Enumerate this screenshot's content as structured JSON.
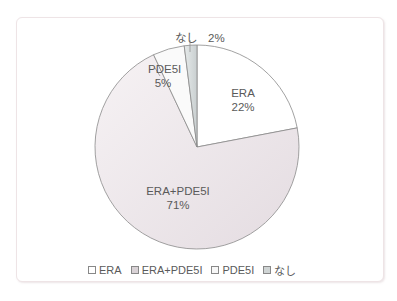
{
  "chart_data": {
    "type": "pie",
    "title": "",
    "categories": [
      "ERA",
      "ERA+PDE5I",
      "PDE5I",
      "なし"
    ],
    "values": [
      22,
      71,
      5,
      2
    ],
    "unit": "%",
    "colors": [
      "#ffffff",
      "#ece6e9",
      "#fbfbfb",
      "#d8dcdc"
    ],
    "labels": [
      {
        "name": "ERA",
        "pct": "22%"
      },
      {
        "name": "ERA+PDE5I",
        "pct": "71%"
      },
      {
        "name": "PDE5I",
        "pct": "5%"
      },
      {
        "name": "なし",
        "pct": "2%"
      }
    ],
    "legend_position": "bottom",
    "start_angle": "12 o'clock, clockwise"
  },
  "legend": [
    {
      "label": "ERA"
    },
    {
      "label": "ERA+PDE5I"
    },
    {
      "label": "PDE5I"
    },
    {
      "label": "なし"
    }
  ],
  "slice_labels": {
    "era_name": "ERA",
    "era_pct": "22%",
    "combo_name": "ERA+PDE5I",
    "combo_pct": "71%",
    "pde_name": "PDE5I",
    "pde_pct": "5%",
    "none_full": "なし　2%"
  }
}
